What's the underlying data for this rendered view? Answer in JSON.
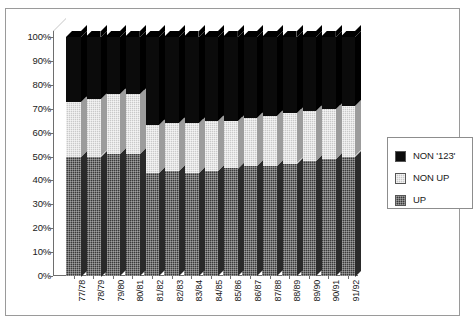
{
  "chart_data": {
    "type": "bar",
    "subtype": "100% stacked column, 3-D",
    "title": "",
    "xlabel": "",
    "ylabel": "",
    "ylim": [
      0,
      100
    ],
    "ytick_labels": [
      "0%",
      "10%",
      "20%",
      "30%",
      "40%",
      "50%",
      "60%",
      "70%",
      "80%",
      "90%",
      "100%"
    ],
    "ytick_values": [
      0,
      10,
      20,
      30,
      40,
      50,
      60,
      70,
      80,
      90,
      100
    ],
    "grid": false,
    "legend_position": "right",
    "categories": [
      "77/78",
      "78/79",
      "79/80",
      "80/81",
      "81/82",
      "82/83",
      "83/84",
      "84/85",
      "85/86",
      "86/87",
      "87/88",
      "88/89",
      "89/90",
      "90/91",
      "91/92"
    ],
    "series": [
      {
        "name": "UP",
        "color": "#3a3a3a",
        "values": [
          50,
          50,
          51,
          51,
          43,
          44,
          43,
          44,
          45,
          46,
          46,
          47,
          48,
          49,
          50
        ]
      },
      {
        "name": "NON UP",
        "color": "#c9c9c9",
        "values": [
          23,
          24,
          25,
          25,
          20,
          20,
          21,
          21,
          20,
          20,
          21,
          21,
          21,
          21,
          21
        ]
      },
      {
        "name": "NON '123'",
        "color": "#0b0b0b",
        "values": [
          27,
          26,
          24,
          24,
          37,
          36,
          36,
          35,
          35,
          34,
          33,
          32,
          31,
          30,
          29
        ]
      }
    ],
    "cumulative_tops": {
      "up": [
        50,
        50,
        51,
        51,
        43,
        44,
        43,
        44,
        45,
        46,
        46,
        47,
        48,
        49,
        50
      ],
      "non_up": [
        73,
        74,
        76,
        76,
        63,
        64,
        64,
        65,
        65,
        66,
        67,
        68,
        69,
        70,
        71
      ],
      "non123": [
        100,
        100,
        100,
        100,
        100,
        100,
        100,
        100,
        100,
        100,
        100,
        100,
        100,
        100,
        100
      ]
    }
  },
  "legend": {
    "items": [
      {
        "label": "NON '123'",
        "swatch": "black-swatch-icon"
      },
      {
        "label": "NON UP",
        "swatch": "light-gray-swatch-icon"
      },
      {
        "label": "UP",
        "swatch": "dark-gray-swatch-icon"
      }
    ]
  }
}
